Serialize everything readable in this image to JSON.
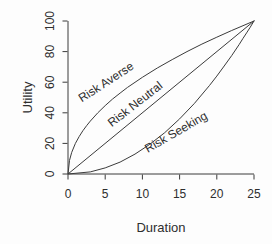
{
  "figure": {
    "background": "#fdfdfd"
  },
  "chart_data": {
    "type": "line",
    "title": "",
    "xlabel": "Duration",
    "ylabel": "Utility",
    "xlim": [
      0,
      25
    ],
    "ylim": [
      0,
      100
    ],
    "x_ticks": [
      0,
      5,
      10,
      15,
      20,
      25
    ],
    "y_ticks": [
      0,
      20,
      40,
      60,
      80,
      100
    ],
    "grid": false,
    "legend_position": "none",
    "axis_color": "#3b3b3b",
    "line_color": "#3b3b3b",
    "text_color": "#2e2e2e",
    "series": [
      {
        "name": "Risk Averse",
        "shape": "concave",
        "x": [
          0,
          0.2,
          0.5,
          1,
          1.5,
          2,
          2.5,
          3,
          4,
          5,
          6,
          7,
          8,
          10,
          12,
          14,
          16,
          18,
          20,
          22,
          25
        ],
        "values": [
          0,
          8.9,
          14.1,
          20,
          24.5,
          28.3,
          31.6,
          34.6,
          40,
          44.7,
          49,
          52.9,
          56.6,
          63.2,
          69.3,
          74.8,
          80,
          84.9,
          89.4,
          93.8,
          100
        ]
      },
      {
        "name": "Risk Neutral",
        "shape": "linear",
        "x": [
          0,
          25
        ],
        "values": [
          0,
          100
        ]
      },
      {
        "name": "Risk Seeking",
        "shape": "convex",
        "x": [
          0,
          3,
          5,
          7,
          9,
          11,
          13,
          15,
          17,
          19,
          20,
          21,
          22,
          23,
          23.5,
          24,
          24.5,
          25
        ],
        "values": [
          0,
          1.4,
          4,
          7.8,
          13,
          19.4,
          27,
          36,
          46.2,
          57.8,
          64,
          70.6,
          77.4,
          84.6,
          88.4,
          92.2,
          96,
          100
        ]
      }
    ],
    "annotations": [
      {
        "text": "Risk Averse",
        "x": 5.1,
        "y": 60.2,
        "angle_deg": -33
      },
      {
        "text": "Risk Neutral",
        "x": 9.0,
        "y": 45.8,
        "angle_deg": -38
      },
      {
        "text": "Risk Seeking",
        "x": 14.5,
        "y": 27.5,
        "angle_deg": -30
      }
    ]
  }
}
